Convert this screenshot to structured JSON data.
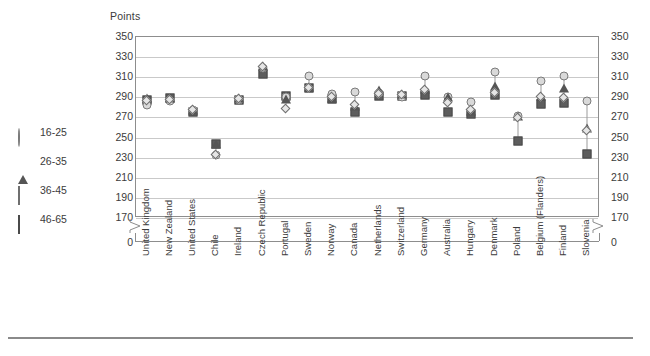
{
  "chart_data": {
    "type": "scatter",
    "title": "",
    "ylabel": "Points",
    "xlabel": "",
    "ylim": [
      170,
      350
    ],
    "yticks": [
      350,
      330,
      310,
      290,
      270,
      250,
      230,
      210,
      190,
      170
    ],
    "axis_break_label": "0",
    "grid": true,
    "legend_position": "left",
    "categories": [
      "United Kingdom",
      "New Zealand",
      "United States",
      "Chile",
      "Ireland",
      "Czech Republic",
      "Portugal",
      "Sweden",
      "Norway",
      "Canada",
      "Netherlands",
      "Switzerland",
      "Germany",
      "Australia",
      "Hungary",
      "Denmark",
      "Poland",
      "Belgium (Flanders)",
      "Finland",
      "Slovenia"
    ],
    "series": [
      {
        "name": "16-25",
        "marker": "circle",
        "values": [
          281,
          285,
          276,
          232,
          286,
          318,
          289,
          310,
          292,
          294,
          293,
          289,
          310,
          289,
          284,
          314,
          270,
          305,
          310,
          285
        ]
      },
      {
        "name": "26-35",
        "marker": "triangle",
        "values": [
          288,
          288,
          276,
          243,
          288,
          320,
          287,
          299,
          288,
          280,
          296,
          292,
          297,
          289,
          275,
          300,
          270,
          290,
          298,
          259
        ]
      },
      {
        "name": "36-45",
        "marker": "diamond",
        "values": [
          285,
          286,
          276,
          232,
          287,
          319,
          277,
          298,
          289,
          281,
          292,
          291,
          296,
          283,
          276,
          293,
          268,
          289,
          288,
          256
        ]
      },
      {
        "name": "46-65",
        "marker": "square",
        "values": [
          286,
          288,
          274,
          243,
          286,
          312,
          290,
          298,
          287,
          274,
          290,
          290,
          291,
          274,
          272,
          291,
          246,
          282,
          283,
          233
        ]
      }
    ]
  },
  "legend": {
    "items": [
      {
        "label": "16-25",
        "marker": "circle"
      },
      {
        "label": "26-35",
        "marker": "triangle"
      },
      {
        "label": "36-45",
        "marker": "diamond"
      },
      {
        "label": "46-65",
        "marker": "square"
      }
    ]
  },
  "colors": {
    "circle_fill": "#d9d9d9",
    "circle_stroke": "#7a7a7a",
    "triangle_fill": "#555555",
    "diamond_fill": "#e6e6e6",
    "diamond_stroke": "#6f6f6f",
    "square_fill": "#5d5d5d",
    "grid": "#c9c9c9",
    "axis": "#8d8d8d",
    "text": "#3b3b3b"
  }
}
